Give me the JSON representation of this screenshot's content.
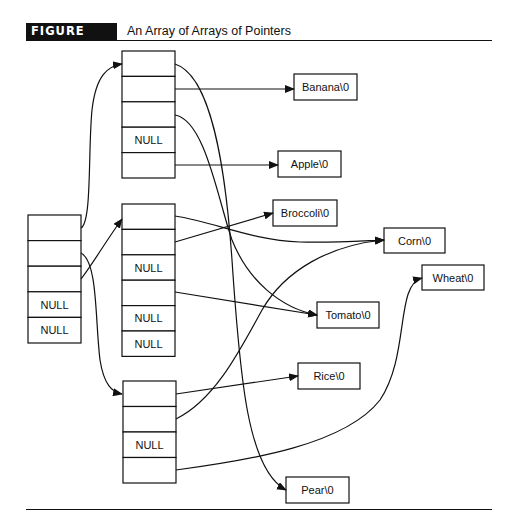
{
  "figure": {
    "label": "FIGURE 10.3",
    "title": "An Array of Arrays of Pointers"
  },
  "null_text": "NULL",
  "arrays": {
    "root": {
      "cells": [
        "",
        "",
        "",
        "NULL",
        "NULL"
      ]
    },
    "fruits": {
      "cells": [
        "",
        "",
        "",
        "NULL",
        ""
      ]
    },
    "vegetables": {
      "cells": [
        "",
        "",
        "NULL",
        "",
        "NULL",
        "NULL"
      ]
    },
    "grains": {
      "cells": [
        "",
        "",
        "NULL",
        ""
      ]
    }
  },
  "strings": {
    "banana": "Banana\\0",
    "apple": "Apple\\0",
    "broccoli": "Broccoli\\0",
    "corn": "Corn\\0",
    "wheat": "Wheat\\0",
    "tomato": "Tomato\\0",
    "rice": "Rice\\0",
    "pear": "Pear\\0"
  },
  "pointers": [
    {
      "from": "root[0]",
      "to": "fruits"
    },
    {
      "from": "root[1]",
      "to": "grains"
    },
    {
      "from": "root[2]",
      "to": "vegetables"
    },
    {
      "from": "fruits[0]",
      "to": "pear"
    },
    {
      "from": "fruits[1]",
      "to": "banana"
    },
    {
      "from": "fruits[2]",
      "to": "tomato"
    },
    {
      "from": "fruits[4]",
      "to": "apple"
    },
    {
      "from": "vegetables[0]",
      "to": "corn"
    },
    {
      "from": "vegetables[1]",
      "to": "broccoli"
    },
    {
      "from": "vegetables[3]",
      "to": "tomato"
    },
    {
      "from": "grains[0]",
      "to": "rice"
    },
    {
      "from": "grains[1]",
      "to": "corn"
    },
    {
      "from": "grains[3]",
      "to": "wheat"
    }
  ]
}
